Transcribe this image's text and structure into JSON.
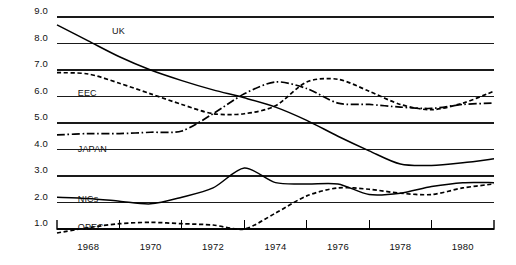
{
  "chart_data": {
    "type": "line",
    "title": "",
    "subtitle": "",
    "xlabel": "",
    "ylabel": "",
    "xlim": [
      1967,
      1981
    ],
    "ylim": [
      1.0,
      9.0
    ],
    "grid": true,
    "grid_axis": "y",
    "legend_position": "inline-labels",
    "y_ticks": [
      "9.0",
      "8.0",
      "7.0",
      "6.0",
      "5.0",
      "4.0",
      "3.0",
      "2.0",
      "1.0"
    ],
    "y_tick_values": [
      9.0,
      8.0,
      7.0,
      6.0,
      5.0,
      4.0,
      3.0,
      2.0,
      1.0
    ],
    "x_ticks": [
      "1968",
      "1970",
      "1972",
      "1974",
      "1976",
      "1978",
      "1980"
    ],
    "x_tick_values": [
      1968,
      1970,
      1972,
      1974,
      1976,
      1978,
      1980
    ],
    "x_minor_tick_values": [
      1969,
      1971,
      1973,
      1975,
      1977,
      1979,
      1981
    ],
    "x": [
      1967,
      1968,
      1969,
      1970,
      1971,
      1972,
      1973,
      1974,
      1975,
      1976,
      1977,
      1978,
      1979,
      1980,
      1981
    ],
    "series": [
      {
        "name": "UK",
        "label": "UK",
        "style": "solid",
        "color": "#000000",
        "values": [
          8.7,
          8.1,
          7.5,
          7.0,
          6.6,
          6.25,
          5.95,
          5.6,
          5.1,
          4.5,
          3.95,
          3.45,
          3.4,
          3.5,
          3.65
        ]
      },
      {
        "name": "EEC",
        "label": "EEC",
        "style": "dashed",
        "color": "#000000",
        "values": [
          6.9,
          6.85,
          6.5,
          6.1,
          5.7,
          5.35,
          5.35,
          5.65,
          6.55,
          6.65,
          6.2,
          5.7,
          5.5,
          5.75,
          6.2
        ]
      },
      {
        "name": "JAPAN",
        "label": "JAPAN",
        "style": "dash-dot",
        "color": "#000000",
        "values": [
          4.55,
          4.6,
          4.6,
          4.65,
          4.7,
          5.35,
          6.1,
          6.55,
          6.3,
          5.75,
          5.7,
          5.6,
          5.55,
          5.7,
          5.75
        ]
      },
      {
        "name": "NICs",
        "label": "NICs",
        "style": "solid",
        "color": "#000000",
        "values": [
          2.2,
          2.15,
          2.05,
          1.95,
          2.2,
          2.55,
          3.3,
          2.75,
          2.7,
          2.7,
          2.3,
          2.35,
          2.6,
          2.75,
          2.75
        ]
      },
      {
        "name": "OPEC",
        "label": "OPEC",
        "style": "dashed",
        "color": "#000000",
        "values": [
          0.85,
          1.05,
          1.2,
          1.25,
          1.2,
          1.15,
          1.0,
          1.6,
          2.25,
          2.55,
          2.5,
          2.35,
          2.3,
          2.55,
          2.7
        ]
      }
    ],
    "annotations": [
      {
        "text": "UK",
        "series": "UK",
        "x": 1968.7,
        "y": 8.45
      },
      {
        "text": "EEC",
        "series": "EEC",
        "x": 1967.6,
        "y": 6.1
      },
      {
        "text": "JAPAN",
        "series": "JAPAN",
        "x": 1967.6,
        "y": 4.0
      },
      {
        "text": "NICs",
        "series": "NICs",
        "x": 1967.6,
        "y": 2.1
      },
      {
        "text": "OPEC",
        "series": "OPEC",
        "x": 1967.6,
        "y": 1.05
      }
    ]
  },
  "axes": {
    "y_tick_labels": [
      {
        "text": "9.0"
      },
      {
        "text": "8.0"
      },
      {
        "text": "7.0"
      },
      {
        "text": "6.0"
      },
      {
        "text": "5.0"
      },
      {
        "text": "4.0"
      },
      {
        "text": "3.0"
      },
      {
        "text": "2.0"
      },
      {
        "text": "1.0"
      }
    ],
    "x_tick_labels": [
      {
        "text": "1968"
      },
      {
        "text": "1970"
      },
      {
        "text": "1972"
      },
      {
        "text": "1974"
      },
      {
        "text": "1976"
      },
      {
        "text": "1978"
      },
      {
        "text": "1980"
      }
    ]
  },
  "style": {
    "line_color": "#000000",
    "grid_color": "#1a1a1a",
    "axis_color": "#000000",
    "background": "#ffffff"
  }
}
